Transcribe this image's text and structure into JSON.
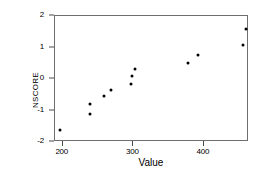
{
  "chart_data": {
    "type": "scatter",
    "title": "",
    "xlabel": "Value",
    "ylabel": "NSCORE",
    "xlim": [
      189,
      464
    ],
    "ylim": [
      -2.0,
      2.0
    ],
    "xticks": [
      200,
      300,
      400
    ],
    "yticks": [
      2,
      1,
      0,
      -1,
      -2
    ],
    "xtick_labels": [
      "200",
      "300",
      "400"
    ],
    "ytick_labels": [
      "2",
      "1",
      "0",
      "-1",
      "-2"
    ],
    "grid": false,
    "legend": null,
    "marker": "filled-circle",
    "marker_color": "#000000",
    "points": [
      {
        "x": 196,
        "y": -1.63
      },
      {
        "x": 238,
        "y": -1.12
      },
      {
        "x": 239,
        "y": -0.79
      },
      {
        "x": 258,
        "y": -0.53
      },
      {
        "x": 268,
        "y": -0.34
      },
      {
        "x": 297,
        "y": -0.16
      },
      {
        "x": 298,
        "y": 0.09
      },
      {
        "x": 303,
        "y": 0.32
      },
      {
        "x": 378,
        "y": 0.51
      },
      {
        "x": 392,
        "y": 0.75
      },
      {
        "x": 455,
        "y": 1.08
      },
      {
        "x": 460,
        "y": 1.6
      }
    ]
  }
}
